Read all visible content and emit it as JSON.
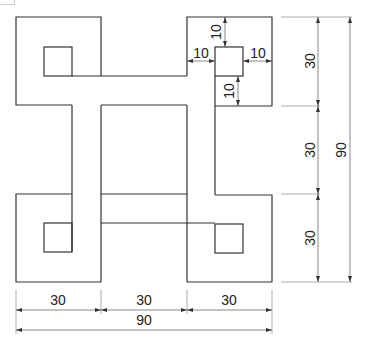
{
  "drawing": {
    "title": "Interlocking square knot pattern",
    "units": "mm",
    "dimensions": {
      "bottom_segments": [
        "30",
        "30",
        "30"
      ],
      "bottom_total": "90",
      "right_segments": [
        "30",
        "30",
        "30"
      ],
      "right_total": "90",
      "detail_top": "10",
      "detail_left": "10",
      "detail_right": "10",
      "detail_bottom": "10"
    }
  }
}
